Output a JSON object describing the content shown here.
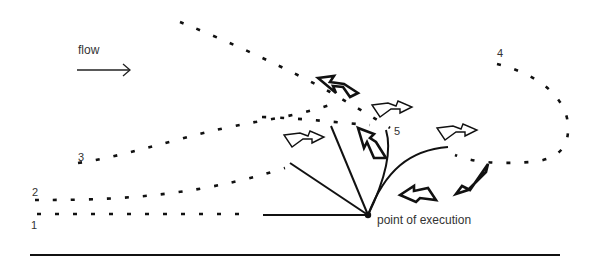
{
  "diagram": {
    "flow_label": "flow",
    "point_label": "point of execution",
    "path_labels": [
      "1",
      "2",
      "3",
      "4",
      "5"
    ],
    "colors": {
      "ink": "#111111",
      "label": "#333333",
      "background": "#ffffff"
    },
    "icons": [
      "flow-arrow-icon",
      "hollow-arrow-icon",
      "bold-arrow-icon"
    ]
  }
}
